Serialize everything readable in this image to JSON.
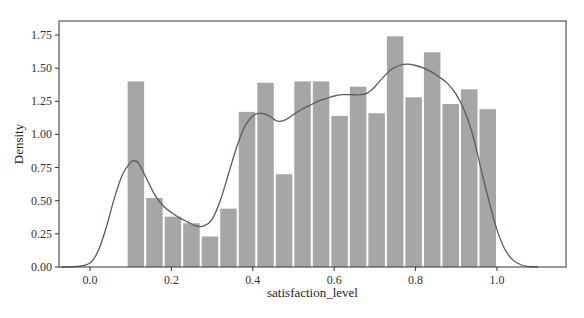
{
  "chart_data": {
    "type": "bar",
    "subtype": "histogram_with_kde",
    "title": "",
    "xlabel": "satisfaction_level",
    "ylabel": "Density",
    "xlim": [
      -0.075,
      1.17
    ],
    "ylim": [
      0,
      1.82
    ],
    "xticks": [
      0.0,
      0.2,
      0.4,
      0.6,
      0.8,
      1.0
    ],
    "xtick_labels": [
      "0.0",
      "0.2",
      "0.4",
      "0.6",
      "0.8",
      "1.0"
    ],
    "yticks": [
      0.0,
      0.25,
      0.5,
      0.75,
      1.0,
      1.25,
      1.5,
      1.75
    ],
    "ytick_labels": [
      "0.00",
      "0.25",
      "0.50",
      "0.75",
      "1.00",
      "1.25",
      "1.50",
      "1.75"
    ],
    "grid": false,
    "legend": null,
    "bins": {
      "start": 0.09,
      "end": 1.0,
      "count": 20,
      "edges": [
        0.09,
        0.1355,
        0.181,
        0.2265,
        0.272,
        0.3175,
        0.363,
        0.4085,
        0.454,
        0.4995,
        0.545,
        0.5905,
        0.636,
        0.6815,
        0.727,
        0.7725,
        0.818,
        0.8635,
        0.909,
        0.9545,
        1.0
      ]
    },
    "values": [
      1.4,
      0.52,
      0.38,
      0.33,
      0.23,
      0.44,
      1.17,
      1.39,
      0.7,
      1.4,
      1.4,
      1.14,
      1.36,
      1.16,
      1.74,
      1.28,
      1.62,
      1.23,
      1.34,
      1.19
    ],
    "kde": {
      "x": [
        -0.07,
        -0.03,
        0.0,
        0.02,
        0.04,
        0.06,
        0.08,
        0.1,
        0.11,
        0.12,
        0.14,
        0.16,
        0.18,
        0.2,
        0.22,
        0.24,
        0.26,
        0.28,
        0.3,
        0.32,
        0.34,
        0.36,
        0.38,
        0.4,
        0.42,
        0.44,
        0.46,
        0.48,
        0.5,
        0.52,
        0.54,
        0.56,
        0.58,
        0.6,
        0.62,
        0.64,
        0.66,
        0.68,
        0.7,
        0.72,
        0.74,
        0.76,
        0.78,
        0.8,
        0.82,
        0.84,
        0.86,
        0.88,
        0.9,
        0.92,
        0.94,
        0.96,
        0.98,
        1.0,
        1.02,
        1.04,
        1.06,
        1.08,
        1.1
      ],
      "y": [
        0.0,
        0.005,
        0.03,
        0.12,
        0.3,
        0.52,
        0.7,
        0.79,
        0.8,
        0.78,
        0.66,
        0.54,
        0.46,
        0.41,
        0.37,
        0.34,
        0.31,
        0.31,
        0.36,
        0.5,
        0.7,
        0.9,
        1.06,
        1.14,
        1.16,
        1.14,
        1.1,
        1.11,
        1.15,
        1.19,
        1.22,
        1.25,
        1.27,
        1.29,
        1.3,
        1.3,
        1.3,
        1.31,
        1.36,
        1.43,
        1.49,
        1.52,
        1.53,
        1.52,
        1.5,
        1.47,
        1.43,
        1.38,
        1.3,
        1.18,
        1.0,
        0.75,
        0.5,
        0.28,
        0.13,
        0.05,
        0.015,
        0.003,
        0.0
      ]
    },
    "colors": {
      "bar_fill": "#a6a6a6",
      "bar_edge": "#ffffff",
      "kde_line": "#555a66",
      "axes": "#333333"
    }
  },
  "labels": {
    "xlabel": "satisfaction_level",
    "ylabel": "Density"
  }
}
